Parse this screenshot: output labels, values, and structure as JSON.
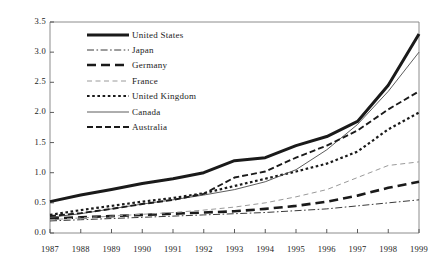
{
  "chart_data": {
    "type": "line",
    "title": "",
    "xlabel": "",
    "ylabel": "",
    "categories": [
      "1987",
      "1988",
      "1989",
      "1990",
      "1991",
      "1992",
      "1993",
      "1994",
      "1995",
      "1996",
      "1997",
      "1998",
      "1999"
    ],
    "x": [
      1987,
      1988,
      1989,
      1990,
      1991,
      1992,
      1993,
      1994,
      1995,
      1996,
      1997,
      1998,
      1999
    ],
    "ylim": [
      0.0,
      3.5
    ],
    "yticks": [
      "0.0",
      "0.5",
      "1.0",
      "1.5",
      "2.0",
      "2.5",
      "3.0",
      "3.5"
    ],
    "ytick_values": [
      0.0,
      0.5,
      1.0,
      1.5,
      2.0,
      2.5,
      3.0,
      3.5
    ],
    "grid": false,
    "legend_position": "upper-left-inside",
    "series": [
      {
        "name": "United States",
        "style": "thick-solid",
        "color": "#1a1a1a",
        "values": [
          0.52,
          0.63,
          0.72,
          0.82,
          0.9,
          1.0,
          1.2,
          1.25,
          1.45,
          1.6,
          1.85,
          2.45,
          3.3
        ]
      },
      {
        "name": "Japan",
        "style": "dash-dot",
        "color": "#3a3a3a",
        "values": [
          0.2,
          0.22,
          0.24,
          0.26,
          0.28,
          0.3,
          0.32,
          0.34,
          0.37,
          0.4,
          0.45,
          0.5,
          0.55
        ]
      },
      {
        "name": "Germany",
        "style": "long-dash",
        "color": "#1a1a1a",
        "values": [
          0.24,
          0.26,
          0.28,
          0.3,
          0.32,
          0.34,
          0.36,
          0.4,
          0.45,
          0.52,
          0.62,
          0.75,
          0.85
        ]
      },
      {
        "name": "France",
        "style": "light-dash",
        "color": "#9a9a9a",
        "values": [
          0.22,
          0.25,
          0.28,
          0.31,
          0.34,
          0.38,
          0.43,
          0.5,
          0.6,
          0.72,
          0.92,
          1.12,
          1.18
        ]
      },
      {
        "name": "United Kingdom",
        "style": "dotted",
        "color": "#1a1a1a",
        "values": [
          0.3,
          0.38,
          0.45,
          0.52,
          0.58,
          0.66,
          0.78,
          0.9,
          1.02,
          1.15,
          1.35,
          1.72,
          2.0
        ]
      },
      {
        "name": "Canada",
        "style": "thin-solid",
        "color": "#4a4a4a",
        "values": [
          0.26,
          0.32,
          0.4,
          0.48,
          0.55,
          0.63,
          0.72,
          0.85,
          1.05,
          1.38,
          1.8,
          2.35,
          3.0
        ]
      },
      {
        "name": "Australia",
        "style": "dashed",
        "color": "#1a1a1a",
        "values": [
          0.28,
          0.33,
          0.4,
          0.48,
          0.55,
          0.65,
          0.92,
          1.02,
          1.25,
          1.45,
          1.7,
          2.05,
          2.35
        ]
      }
    ]
  },
  "legend": {
    "items": [
      {
        "label": "United States"
      },
      {
        "label": "Japan"
      },
      {
        "label": "Germany"
      },
      {
        "label": "France"
      },
      {
        "label": "United Kingdom"
      },
      {
        "label": "Canada"
      },
      {
        "label": "Australia"
      }
    ]
  }
}
